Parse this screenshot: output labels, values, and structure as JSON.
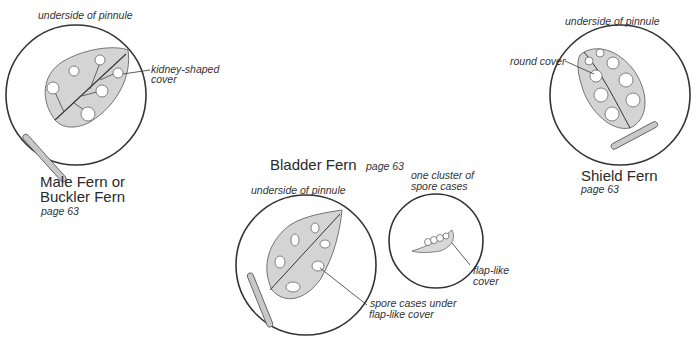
{
  "male_fern": {
    "caption": "underside of pinnule",
    "callout_line1": "kidney-shaped",
    "callout_line2": "cover",
    "title_line1": "Male Fern or",
    "title_line2": "Buckler Fern",
    "page": "page 63"
  },
  "shield_fern": {
    "caption": "underside of pinnule",
    "callout": "round cover",
    "title": "Shield Fern",
    "page": "page 63"
  },
  "bladder_fern": {
    "title": "Bladder Fern",
    "page": "page 63",
    "caption": "underside of pinnule",
    "callout_line1": "spore cases under",
    "callout_line2": "flap-like cover",
    "cluster_caption_line1": "one cluster of",
    "cluster_caption_line2": "spore cases",
    "cluster_callout_line1": "flap-like",
    "cluster_callout_line2": "cover"
  },
  "colors": {
    "leaf_fill": "#d4d4d4",
    "outline": "#333333",
    "stem_fill": "#c8c8c8"
  }
}
